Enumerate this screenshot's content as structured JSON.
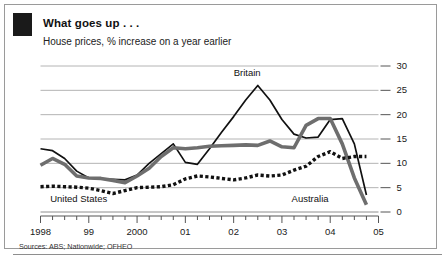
{
  "header": {
    "title": "What goes up . . .",
    "subtitle": "House prices, % increase on a year earlier",
    "accent_color": "#1a1a1a"
  },
  "footer": {
    "sources": "Sources: ABS; Nationwide; OFHEO"
  },
  "chart_data": {
    "type": "line",
    "title": "What goes up . . .",
    "subtitle": "House prices, % increase on a year earlier",
    "xlabel": "",
    "ylabel": "% increase on a year earlier",
    "ylim": [
      0,
      30
    ],
    "yticks": [
      0,
      5,
      10,
      15,
      20,
      25,
      30
    ],
    "ytick_labels": [
      "0",
      "5",
      "10",
      "15",
      "20",
      "25",
      "30"
    ],
    "y_axis_position": "right",
    "grid": true,
    "legend": "inline-annotations",
    "xlim": [
      1998.0,
      2005.0
    ],
    "xticks": [
      1998,
      1999,
      2000,
      2001,
      2002,
      2003,
      2004,
      2005
    ],
    "xtick_labels": [
      "1998",
      "99",
      "2000",
      "01",
      "02",
      "03",
      "04",
      "05"
    ],
    "minor_ticks": "quarterly",
    "x": [
      1998.0,
      1998.25,
      1998.5,
      1998.75,
      1999.0,
      1999.25,
      1999.5,
      1999.75,
      2000.0,
      2000.25,
      2000.5,
      2000.75,
      2001.0,
      2001.25,
      2001.5,
      2001.75,
      2002.0,
      2002.25,
      2002.5,
      2002.75,
      2003.0,
      2003.25,
      2003.5,
      2003.75,
      2004.0,
      2004.25,
      2004.5,
      2004.75
    ],
    "series": [
      {
        "name": "Britain",
        "style": "solid-thin-black",
        "color": "#111111",
        "values": [
          13.0,
          12.6,
          11.0,
          8.4,
          7.0,
          6.8,
          6.7,
          6.6,
          7.6,
          10.0,
          12.0,
          14.0,
          10.2,
          9.8,
          13.0,
          16.4,
          19.6,
          23.0,
          26.0,
          23.0,
          19.0,
          16.0,
          15.2,
          15.4,
          19.0,
          19.2,
          14.0,
          3.5
        ]
      },
      {
        "name": "Australia",
        "style": "solid-thick-gray",
        "color": "#6e6e6e",
        "values": [
          9.6,
          11.0,
          9.8,
          7.4,
          7.0,
          6.9,
          6.5,
          6.0,
          7.4,
          9.0,
          11.4,
          13.2,
          13.0,
          13.2,
          13.5,
          13.6,
          13.7,
          13.8,
          13.7,
          14.6,
          13.4,
          13.2,
          17.8,
          19.2,
          19.2,
          14.0,
          7.0,
          1.5
        ]
      },
      {
        "name": "United States",
        "style": "dotted-black",
        "color": "#111111",
        "values": [
          5.2,
          5.3,
          5.2,
          5.1,
          4.9,
          4.4,
          3.8,
          4.4,
          5.0,
          5.1,
          5.2,
          5.6,
          6.8,
          7.4,
          7.2,
          6.9,
          6.6,
          7.0,
          7.6,
          7.4,
          7.6,
          8.6,
          9.4,
          11.4,
          12.4,
          11.0,
          11.4,
          11.4
        ]
      }
    ],
    "annotations": [
      {
        "text": "Britain",
        "x": 2002.0,
        "y": 28.5
      },
      {
        "text": "Australia",
        "x": 2003.2,
        "y": 2.6
      },
      {
        "text": "United States",
        "x": 1998.2,
        "y": 2.6
      }
    ]
  }
}
